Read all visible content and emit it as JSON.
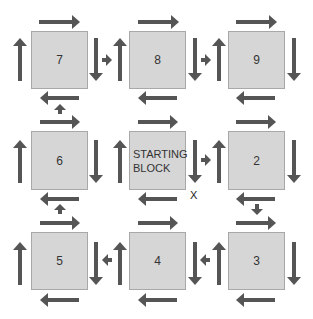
{
  "diagram": {
    "block_color": "#d6d6d6",
    "arrow_color": "#555555",
    "blocks": [
      {
        "id": "7",
        "label": "7",
        "x": 31,
        "y": 31,
        "w": 57,
        "h": 58
      },
      {
        "id": "8",
        "label": "8",
        "x": 129,
        "y": 31,
        "w": 57,
        "h": 58
      },
      {
        "id": "9",
        "label": "9",
        "x": 228,
        "y": 31,
        "w": 57,
        "h": 58
      },
      {
        "id": "6",
        "label": "6",
        "x": 31,
        "y": 131,
        "w": 57,
        "h": 59
      },
      {
        "id": "start",
        "label": "STARTING\nBLOCK",
        "x": 129,
        "y": 131,
        "w": 57,
        "h": 59,
        "start": true
      },
      {
        "id": "2",
        "label": "2",
        "x": 228,
        "y": 131,
        "w": 57,
        "h": 59
      },
      {
        "id": "5",
        "label": "5",
        "x": 31,
        "y": 232,
        "w": 57,
        "h": 58
      },
      {
        "id": "4",
        "label": "4",
        "x": 129,
        "y": 232,
        "w": 57,
        "h": 58
      },
      {
        "id": "3",
        "label": "3",
        "x": 228,
        "y": 232,
        "w": 57,
        "h": 58
      }
    ],
    "arrows": [
      {
        "dir": "right",
        "x": 39,
        "y": 22,
        "len": 41
      },
      {
        "dir": "up",
        "x": 20,
        "y": 38,
        "len": 43
      },
      {
        "dir": "down",
        "x": 96,
        "y": 38,
        "len": 43
      },
      {
        "dir": "left",
        "x": 40,
        "y": 98,
        "len": 39
      },
      {
        "dir": "right",
        "x": 102,
        "y": 60,
        "len": 10,
        "small": true
      },
      {
        "dir": "up",
        "x": 120,
        "y": 38,
        "len": 43
      },
      {
        "dir": "right",
        "x": 138,
        "y": 22,
        "len": 41
      },
      {
        "dir": "down",
        "x": 195,
        "y": 38,
        "len": 43
      },
      {
        "dir": "left",
        "x": 138,
        "y": 98,
        "len": 39
      },
      {
        "dir": "right",
        "x": 201,
        "y": 60,
        "len": 10,
        "small": true
      },
      {
        "dir": "up",
        "x": 219,
        "y": 38,
        "len": 43
      },
      {
        "dir": "right",
        "x": 236,
        "y": 22,
        "len": 41
      },
      {
        "dir": "down",
        "x": 294,
        "y": 38,
        "len": 43
      },
      {
        "dir": "left",
        "x": 236,
        "y": 98,
        "len": 39
      },
      {
        "dir": "up",
        "x": 60,
        "y": 104,
        "len": 10,
        "small": true
      },
      {
        "dir": "right",
        "x": 40,
        "y": 122,
        "len": 40
      },
      {
        "dir": "up",
        "x": 20,
        "y": 140,
        "len": 43
      },
      {
        "dir": "down",
        "x": 96,
        "y": 140,
        "len": 43
      },
      {
        "dir": "left",
        "x": 40,
        "y": 199,
        "len": 39
      },
      {
        "dir": "right",
        "x": 138,
        "y": 122,
        "len": 40
      },
      {
        "dir": "up",
        "x": 120,
        "y": 140,
        "len": 43
      },
      {
        "dir": "down",
        "x": 195,
        "y": 140,
        "len": 43
      },
      {
        "dir": "left",
        "x": 138,
        "y": 199,
        "len": 39
      },
      {
        "dir": "right",
        "x": 201,
        "y": 160,
        "len": 10,
        "small": true
      },
      {
        "dir": "up",
        "x": 219,
        "y": 140,
        "len": 43
      },
      {
        "dir": "right",
        "x": 236,
        "y": 122,
        "len": 40
      },
      {
        "dir": "down",
        "x": 294,
        "y": 140,
        "len": 43
      },
      {
        "dir": "left",
        "x": 236,
        "y": 199,
        "len": 39
      },
      {
        "dir": "down",
        "x": 257,
        "y": 204,
        "len": 11,
        "small": true
      },
      {
        "dir": "up",
        "x": 60,
        "y": 204,
        "len": 10,
        "small": true
      },
      {
        "dir": "right",
        "x": 40,
        "y": 223,
        "len": 40
      },
      {
        "dir": "up",
        "x": 20,
        "y": 242,
        "len": 43
      },
      {
        "dir": "down",
        "x": 96,
        "y": 242,
        "len": 43
      },
      {
        "dir": "left",
        "x": 40,
        "y": 300,
        "len": 39
      },
      {
        "dir": "left",
        "x": 102,
        "y": 260,
        "len": 10,
        "small": true
      },
      {
        "dir": "up",
        "x": 120,
        "y": 242,
        "len": 43
      },
      {
        "dir": "right",
        "x": 138,
        "y": 223,
        "len": 40
      },
      {
        "dir": "down",
        "x": 195,
        "y": 242,
        "len": 43
      },
      {
        "dir": "left",
        "x": 138,
        "y": 300,
        "len": 39
      },
      {
        "dir": "left",
        "x": 200,
        "y": 260,
        "len": 10,
        "small": true
      },
      {
        "dir": "up",
        "x": 219,
        "y": 242,
        "len": 43
      },
      {
        "dir": "right",
        "x": 236,
        "y": 223,
        "len": 40
      },
      {
        "dir": "down",
        "x": 294,
        "y": 242,
        "len": 43
      },
      {
        "dir": "left",
        "x": 236,
        "y": 300,
        "len": 39
      }
    ],
    "marker": {
      "label": "X",
      "x": 190,
      "y": 189
    }
  }
}
